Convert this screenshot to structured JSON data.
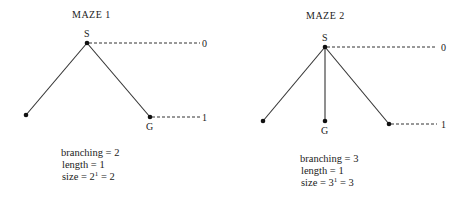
{
  "maze1": {
    "title": "MAZE 1",
    "start_label": "S",
    "goal_label": "G",
    "level_labels": [
      "0",
      "1"
    ],
    "branching_text": "branching = 2",
    "length_text": "length = 1",
    "size_prefix": "size = 2",
    "size_exp": "1",
    "size_suffix": " = 2"
  },
  "maze2": {
    "title": "MAZE 2",
    "start_label": "S",
    "goal_label": "G",
    "level_labels": [
      "0",
      "1"
    ],
    "branching_text": "branching = 3",
    "length_text": "length = 1",
    "size_prefix": "size = 3",
    "size_exp": "1",
    "size_suffix": " = 3"
  }
}
